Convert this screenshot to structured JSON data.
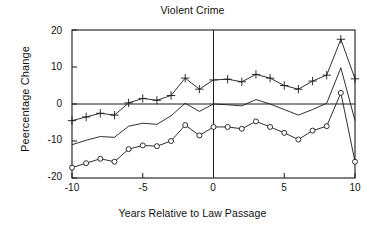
{
  "chart_data": {
    "type": "line",
    "title": "Violent Crime",
    "xlabel": "Years Relative to Law Passage",
    "ylabel": "Peercentage Change",
    "xlim": [
      -10,
      10
    ],
    "ylim": [
      -20,
      20
    ],
    "xticks": [
      -10,
      -5,
      0,
      5,
      10
    ],
    "xtick_labels": [
      "-10",
      "-5",
      "0",
      "5",
      "10"
    ],
    "yticks": [
      -20,
      -10,
      0,
      10,
      20
    ],
    "ytick_labels": [
      "-20",
      "-10",
      "0",
      "10",
      "20"
    ],
    "grid": false,
    "legend": "none",
    "zero_line": true,
    "vertical_reference_line_at_x": 0,
    "x": [
      -10,
      -9,
      -8,
      -7,
      -6,
      -5,
      -4,
      -3,
      -2,
      -1,
      0,
      1,
      2,
      3,
      4,
      5,
      6,
      7,
      8,
      9,
      10
    ],
    "series": [
      {
        "name": "upper-bound",
        "marker": "plus",
        "values": [
          -4.5,
          -3.5,
          -2.5,
          -3.0,
          0.3,
          1.5,
          1.0,
          2.3,
          7.0,
          4.0,
          6.5,
          6.7,
          6.0,
          8.0,
          7.0,
          5.0,
          4.0,
          6.2,
          7.8,
          17.5,
          6.8
        ]
      },
      {
        "name": "point-estimate",
        "marker": "none",
        "values": [
          -11.0,
          -9.8,
          -8.8,
          -9.0,
          -6.0,
          -5.2,
          -5.5,
          -3.2,
          0.2,
          -2.0,
          0.0,
          -0.2,
          -0.5,
          1.2,
          0.0,
          -1.5,
          -3.0,
          -1.5,
          0.2,
          9.8,
          -4.5
        ]
      },
      {
        "name": "lower-bound",
        "marker": "circle",
        "values": [
          -17.2,
          -16.0,
          -14.8,
          -15.6,
          -12.2,
          -11.2,
          -11.4,
          -10.0,
          -5.7,
          -8.5,
          -6.2,
          -6.2,
          -6.7,
          -4.7,
          -6.2,
          -7.8,
          -9.6,
          -7.2,
          -6.0,
          3.0,
          -15.6
        ]
      }
    ]
  }
}
